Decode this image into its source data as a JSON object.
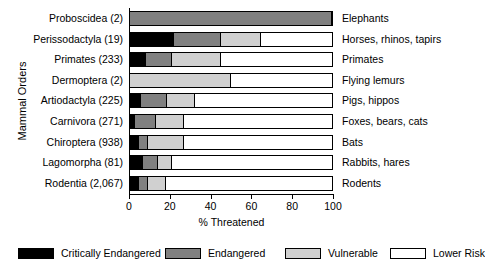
{
  "chart_data": {
    "type": "bar",
    "orientation": "horizontal",
    "stacked": true,
    "title": "",
    "xlabel": "% Threatened",
    "ylabel": "Mammal Orders",
    "xlim": [
      0,
      100
    ],
    "xticks": [
      0,
      20,
      40,
      60,
      80,
      100
    ],
    "xtick_labels": [
      "0",
      "20",
      "40",
      "60",
      "80",
      "100"
    ],
    "grid": false,
    "legend_position": "bottom",
    "categories": [
      "Proboscidea (2)",
      "Perissodactyla (19)",
      "Primates (233)",
      "Dermoptera (2)",
      "Artiodactyla (225)",
      "Carnivora (271)",
      "Chiroptera (938)",
      "Lagomorpha (81)",
      "Rodentia (2,067)"
    ],
    "common_names": [
      "Elephants",
      "Horses, rhinos, tapirs",
      "Primates",
      "Flying lemurs",
      "Pigs, hippos",
      "Foxes, bears, cats",
      "Bats",
      "Rabbits, hares",
      "Rodents"
    ],
    "series": [
      {
        "name": "Critically Endangered",
        "color": "#000000",
        "values": [
          0,
          22,
          8,
          0,
          5.5,
          2.5,
          4.5,
          6.5,
          4.5
        ]
      },
      {
        "name": "Endangered",
        "color": "#808080",
        "values": [
          100,
          23,
          13,
          0,
          13,
          10.5,
          4.5,
          7.5,
          4.5
        ]
      },
      {
        "name": "Vulnerable",
        "color": "#d0d0d0",
        "values": [
          0,
          20,
          24,
          50,
          13.5,
          13.5,
          17.5,
          7,
          9
        ]
      },
      {
        "name": "Lower Risk",
        "color": "#ffffff",
        "values": [
          0,
          35,
          55,
          50,
          68,
          73.5,
          73.5,
          79,
          82
        ]
      }
    ],
    "totals": [
      100,
      100,
      100,
      100,
      100,
      100,
      100,
      100,
      100
    ]
  },
  "legend": {
    "items": [
      {
        "label": "Critically Endangered",
        "color": "#000000"
      },
      {
        "label": "Endangered",
        "color": "#808080"
      },
      {
        "label": "Vulnerable",
        "color": "#d0d0d0"
      },
      {
        "label": "Lower Risk",
        "color": "#ffffff"
      }
    ]
  }
}
